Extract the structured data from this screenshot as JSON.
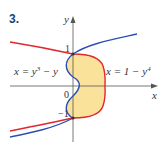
{
  "problem": {
    "number": "3."
  },
  "axes": {
    "x_label": "x",
    "y_label": "y",
    "origin_label": "0",
    "tick_top": "1",
    "tick_bottom": "−1"
  },
  "curves": [
    {
      "name": "red-curve",
      "equation": "x = 1 − y⁴",
      "color": "#e0282e"
    },
    {
      "name": "blue-curve",
      "equation": "x = y³ − y",
      "color": "#2a4fb0"
    }
  ],
  "labels": {
    "left_eq_prefix": "x = y",
    "left_eq_exp": "3",
    "left_eq_suffix": " − y",
    "right_eq_prefix": "x = 1 − y",
    "right_eq_exp": "4"
  },
  "colors": {
    "region_fill": "#fbe29a",
    "axis": "#555555",
    "number": "#1a3f7a"
  }
}
